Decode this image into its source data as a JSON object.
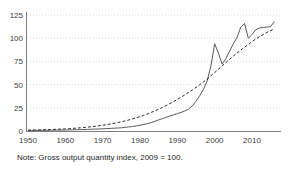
{
  "note": "Note: Gross output quantity index, 2009 = 100.",
  "colors": {
    "background": "#ffffff",
    "axis": "#7f7f7f",
    "grid": "#d9d9d9",
    "text": "#404040",
    "solid_series": "#5a5a5a",
    "dashed_series": "#2b2b2b"
  },
  "chart_data": {
    "type": "line",
    "title": "",
    "xlabel": "",
    "ylabel": "",
    "xlim": [
      1950,
      2016
    ],
    "ylim": [
      0,
      125
    ],
    "x_ticks": [
      1950,
      1960,
      1970,
      1980,
      1990,
      2000,
      2010
    ],
    "y_ticks": [
      0,
      25,
      50,
      75,
      100,
      125
    ],
    "grid": "horizontal-dotted",
    "legend": "none",
    "x": [
      1950,
      1951,
      1952,
      1953,
      1954,
      1955,
      1956,
      1957,
      1958,
      1959,
      1960,
      1961,
      1962,
      1963,
      1964,
      1965,
      1966,
      1967,
      1968,
      1969,
      1970,
      1971,
      1972,
      1973,
      1974,
      1975,
      1976,
      1977,
      1978,
      1979,
      1980,
      1981,
      1982,
      1983,
      1984,
      1985,
      1986,
      1987,
      1988,
      1989,
      1990,
      1991,
      1992,
      1993,
      1994,
      1995,
      1996,
      1997,
      1998,
      1999,
      2000,
      2001,
      2002,
      2003,
      2004,
      2005,
      2006,
      2007,
      2008,
      2009,
      2010,
      2011,
      2012,
      2013,
      2014,
      2015,
      2016
    ],
    "series": [
      {
        "name": "gross-output-actual",
        "style": "solid",
        "color": "#5a5a5a",
        "values": [
          0.6,
          0.6,
          0.7,
          0.7,
          0.8,
          0.8,
          0.9,
          0.9,
          1.0,
          1.0,
          1.1,
          1.2,
          1.3,
          1.4,
          1.5,
          1.6,
          1.7,
          1.9,
          2.0,
          2.2,
          2.4,
          2.6,
          2.8,
          3.0,
          3.2,
          3.5,
          4.0,
          4.4,
          4.9,
          5.5,
          6.2,
          7.0,
          8.0,
          9.2,
          10.5,
          12.0,
          13.4,
          14.8,
          16.2,
          17.5,
          18.8,
          20.2,
          21.6,
          23.5,
          27.0,
          32.0,
          38.0,
          45.0,
          54.0,
          70.0,
          94.0,
          84.0,
          72.0,
          78.0,
          86.0,
          94.0,
          101.0,
          112.0,
          116.0,
          100.0,
          104.0,
          109.0,
          111.0,
          111.5,
          112.0,
          112.5,
          118.0
        ]
      },
      {
        "name": "gross-output-trend",
        "style": "dashed",
        "color": "#2b2b2b",
        "values": [
          0.9,
          1.0,
          1.1,
          1.2,
          1.3,
          1.4,
          1.6,
          1.7,
          1.9,
          2.1,
          2.3,
          2.5,
          2.8,
          3.1,
          3.4,
          3.8,
          4.2,
          4.6,
          5.1,
          5.6,
          6.2,
          6.8,
          7.5,
          8.2,
          9.0,
          9.9,
          10.9,
          11.9,
          13.0,
          14.2,
          15.5,
          16.9,
          18.4,
          20.0,
          21.7,
          23.5,
          25.4,
          27.4,
          29.5,
          31.7,
          34.0,
          36.4,
          38.9,
          41.5,
          44.2,
          47.0,
          49.9,
          52.9,
          56.0,
          59.5,
          63.0,
          66.6,
          70.2,
          73.8,
          77.3,
          80.7,
          84.0,
          87.2,
          90.3,
          93.3,
          96.2,
          99.0,
          101.7,
          104.0,
          106.2,
          108.2,
          110.0
        ]
      }
    ]
  }
}
